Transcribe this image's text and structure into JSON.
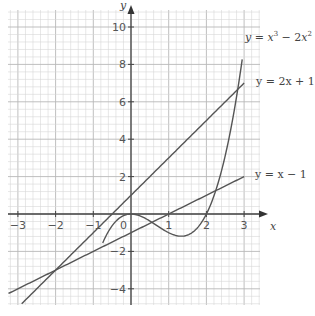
{
  "chart_data": {
    "type": "line",
    "title": "",
    "xlabel": "x",
    "ylabel": "y",
    "xlim": [
      -3.25,
      3.4
    ],
    "ylim": [
      -4.9,
      10.9
    ],
    "grid": true,
    "x_ticks": [
      -3,
      -2,
      -1,
      0,
      1,
      2,
      3
    ],
    "x_tick_labels": [
      "−3",
      "−2",
      "−1",
      "0",
      "1",
      "2",
      "3"
    ],
    "y_ticks": [
      -4,
      -2,
      2,
      4,
      6,
      8,
      10
    ],
    "y_tick_labels": [
      "−4",
      "−2",
      "2",
      "4",
      "6",
      "8",
      "10"
    ],
    "origin_label": "0",
    "series": [
      {
        "name": "y = x³ − 2x²",
        "expr": "cubic",
        "x_range": [
          -0.75,
          2.95
        ],
        "x": [
          -0.75,
          -0.5,
          -0.25,
          0,
          0.5,
          1,
          1.33,
          1.5,
          2,
          2.5,
          2.95
        ],
        "y": [
          -1.55,
          -0.625,
          -0.14,
          0,
          -0.375,
          -1,
          -1.19,
          -1.125,
          0,
          3.125,
          8.3
        ]
      },
      {
        "name": "y = 2x + 1",
        "expr": "2x+1",
        "x_range": [
          -2.9,
          3
        ],
        "x": [
          -2.9,
          3
        ],
        "y": [
          -4.8,
          7
        ]
      },
      {
        "name": "y = x − 1",
        "expr": "x-1",
        "x_range": [
          -3.25,
          3
        ],
        "x": [
          -3.25,
          3
        ],
        "y": [
          -4.25,
          2
        ]
      }
    ],
    "annotations": [
      {
        "text": "y = x³ − 2x²",
        "at": "upper right, near (3, 9.3)"
      },
      {
        "text": "y = 2x + 1",
        "at": "right, near (3, 7)"
      },
      {
        "text": "y = x − 1",
        "at": "right, near (3, 2)"
      }
    ],
    "legend_position": "inline labels at right"
  },
  "labels": {
    "curve": {
      "y": "y",
      "eq": " = x",
      "sup1": "3",
      "mid": " − 2x",
      "sup2": "2"
    },
    "line1": "y = 2x + 1",
    "line2": "y = x − 1",
    "x_axis": "x",
    "y_axis": "y"
  },
  "colors": {
    "curve": "#555555",
    "grid_minor": "#d6d6d6",
    "grid_major": "#b8b8b8",
    "axis": "#444444"
  }
}
